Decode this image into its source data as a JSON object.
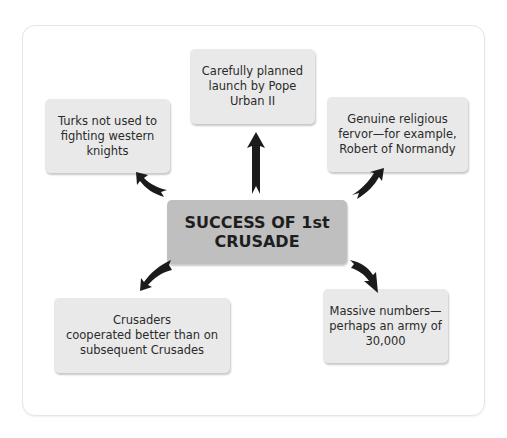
{
  "diagram": {
    "center": {
      "line1": "SUCCESS OF 1st",
      "line2": "CRUSADE"
    },
    "nodes": [
      {
        "id": "top",
        "lines": [
          "Carefully planned",
          "launch by Pope",
          "Urban II"
        ]
      },
      {
        "id": "top-left",
        "lines": [
          "Turks not used to",
          "fighting western",
          "knights"
        ]
      },
      {
        "id": "top-right",
        "lines": [
          "Genuine religious",
          "fervor—for example,",
          "Robert of Normandy"
        ]
      },
      {
        "id": "bottom-left",
        "lines": [
          "Crusaders",
          "cooperated better than on",
          "subsequent Crusades"
        ]
      },
      {
        "id": "bottom-right",
        "lines": [
          "Massive numbers—",
          "perhaps an army of",
          "30,000"
        ]
      }
    ],
    "colors": {
      "center_fill": "#bfbfbf",
      "node_fill": "#e9e9e9",
      "arrow": "#1b1b1b"
    }
  }
}
